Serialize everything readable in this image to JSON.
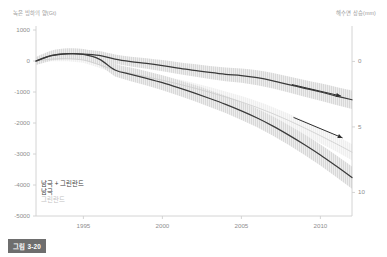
{
  "figure": {
    "caption_badge": "그림 3-20"
  },
  "chart_data": {
    "type": "line",
    "title": "",
    "subtitle": "",
    "xlabel": "",
    "ylabel": "녹은 빙하의 양(Gt)",
    "ylabel_right": "해수면 상승(mm)",
    "grid": false,
    "legend_position": "bottom-left",
    "xlim": [
      1992,
      2012
    ],
    "ylim": [
      -5000,
      1000
    ],
    "ylim_right": [
      11.8,
      -2.4
    ],
    "xticks": [
      1995,
      2000,
      2005,
      2010
    ],
    "xticklabels": [
      "1995",
      "2000",
      "2005",
      "2010"
    ],
    "yticks": [
      1000,
      0,
      -1000,
      -2000,
      -3000,
      -4000,
      -5000
    ],
    "yticklabels": [
      "1000",
      "0",
      "-1000",
      "-2000",
      "-3000",
      "-4000",
      "-5000"
    ],
    "yticks_right": [
      0,
      5,
      10
    ],
    "yticklabels_right": [
      "0",
      "5",
      "10"
    ],
    "x": [
      1992,
      1993,
      1994,
      1995,
      1996,
      1997,
      1998,
      1999,
      2000,
      2001,
      2002,
      2003,
      2004,
      2005,
      2006,
      2007,
      2008,
      2009,
      2010,
      2011,
      2012
    ],
    "series": [
      {
        "name": "남극",
        "color": "#3a3a3a",
        "band_color": "#d8d8d8",
        "values": [
          0,
          170,
          230,
          225,
          180,
          60,
          -20,
          -80,
          -150,
          -230,
          -300,
          -370,
          -430,
          -470,
          -540,
          -640,
          -760,
          -880,
          -1000,
          -1130,
          -1250
        ],
        "band_upper": [
          110,
          300,
          360,
          360,
          320,
          210,
          140,
          90,
          30,
          -40,
          -100,
          -160,
          -210,
          -240,
          -300,
          -390,
          -500,
          -610,
          -720,
          -840,
          -950
        ],
        "band_lower": [
          -110,
          40,
          100,
          90,
          40,
          -90,
          -180,
          -250,
          -330,
          -420,
          -500,
          -580,
          -650,
          -700,
          -780,
          -890,
          -1020,
          -1150,
          -1280,
          -1420,
          -1550
        ]
      },
      {
        "name": "그린란드",
        "color": "#cccccc",
        "band_color": "#efefef",
        "values": [
          0,
          60,
          70,
          30,
          -120,
          -290,
          -400,
          -510,
          -620,
          -740,
          -870,
          -1010,
          -1160,
          -1320,
          -1500,
          -1700,
          -1920,
          -2160,
          -2410,
          -2670,
          -2940
        ],
        "band_upper": [
          60,
          130,
          150,
          120,
          -20,
          -180,
          -280,
          -380,
          -480,
          -590,
          -710,
          -840,
          -980,
          -1130,
          -1300,
          -1490,
          -1700,
          -1930,
          -2170,
          -2420,
          -2680
        ],
        "band_lower": [
          -60,
          -10,
          -10,
          -60,
          -220,
          -400,
          -520,
          -640,
          -760,
          -890,
          -1030,
          -1180,
          -1340,
          -1510,
          -1700,
          -1910,
          -2140,
          -2390,
          -2650,
          -2920,
          -3200
        ]
      },
      {
        "name": "남극 + 그린란드",
        "color": "#3a3a3a",
        "band_color": "#d8d8d8",
        "values": [
          0,
          180,
          240,
          210,
          60,
          -290,
          -430,
          -560,
          -700,
          -860,
          -1030,
          -1210,
          -1400,
          -1610,
          -1840,
          -2100,
          -2390,
          -2700,
          -3030,
          -3390,
          -3760
        ],
        "band_upper": [
          130,
          340,
          410,
          390,
          250,
          -80,
          -210,
          -330,
          -460,
          -610,
          -770,
          -940,
          -1120,
          -1320,
          -1540,
          -1790,
          -2070,
          -2370,
          -2690,
          -3040,
          -3400
        ],
        "band_lower": [
          -130,
          20,
          70,
          30,
          -130,
          -500,
          -650,
          -790,
          -940,
          -1110,
          -1290,
          -1480,
          -1680,
          -1900,
          -2140,
          -2410,
          -2710,
          -3030,
          -3370,
          -3740,
          -4120
        ]
      }
    ],
    "annotations": [
      {
        "name": "trend-arrow-upper",
        "type": "arrow",
        "from": {
          "x": 2008.2,
          "y": -760
        },
        "to": {
          "x": 2011.3,
          "y": -1130
        }
      },
      {
        "name": "trend-arrow-lower",
        "type": "arrow",
        "from": {
          "x": 2008.3,
          "y": -1820
        },
        "to": {
          "x": 2011.4,
          "y": -2480
        }
      }
    ]
  }
}
